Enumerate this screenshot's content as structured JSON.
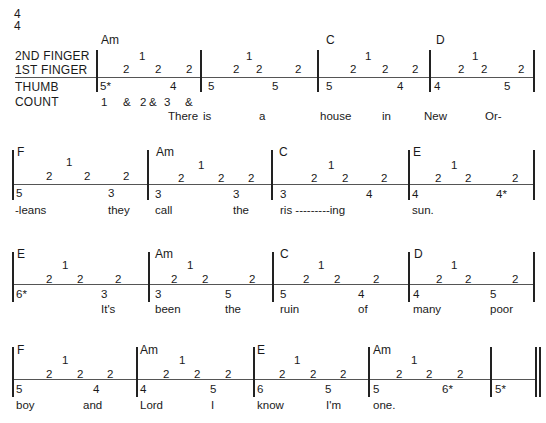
{
  "time_signature": {
    "top": "4",
    "bottom": "4"
  },
  "labels": {
    "second_finger": "2ND FINGER",
    "first_finger": "1ST FINGER",
    "thumb": "THUMB",
    "count": "COUNT"
  },
  "count_values": [
    "1",
    "&",
    "2",
    "&",
    "3",
    "&"
  ],
  "rows": [
    {
      "staff_y": 77,
      "measures": [
        {
          "chord": "Am",
          "f2": "1",
          "f1": [
            "2",
            "2",
            "2"
          ],
          "thumb": [
            "5*",
            "4"
          ]
        },
        {
          "chord": "",
          "f2": "1",
          "f1": [
            "2",
            "2",
            "2"
          ],
          "thumb": [
            "5",
            "5"
          ]
        },
        {
          "chord": "C",
          "f2": "1",
          "f1": [
            "2",
            "2",
            "2"
          ],
          "thumb": [
            "5",
            "4"
          ]
        },
        {
          "chord": "D",
          "f2": "1",
          "f1": [
            "2",
            "2",
            "2"
          ],
          "thumb": [
            "4",
            "5"
          ]
        }
      ],
      "lyrics": [
        "There",
        "is",
        "a",
        "house",
        "in",
        "New",
        "Or-"
      ]
    },
    {
      "staff_y": 184,
      "measures": [
        {
          "chord": "F",
          "f2": "1",
          "f1": [
            "2",
            "2",
            "2"
          ],
          "thumb": [
            "5",
            "3"
          ]
        },
        {
          "chord": "Am",
          "f2": "1",
          "f1": [
            "2",
            "2",
            "2"
          ],
          "thumb": [
            "3",
            "3"
          ]
        },
        {
          "chord": "C",
          "f2": "1",
          "f1": [
            "2",
            "2",
            "2"
          ],
          "thumb": [
            "3",
            "4"
          ]
        },
        {
          "chord": "E",
          "f2": "1",
          "f1": [
            "2",
            "2",
            "2"
          ],
          "thumb": [
            "4",
            "4*"
          ]
        }
      ],
      "lyrics": [
        "-leans",
        "they",
        "call",
        "the",
        "ris ---------ing",
        "sun."
      ]
    },
    {
      "staff_y": 284,
      "measures": [
        {
          "chord": "E",
          "f2": "1",
          "f1": [
            "2",
            "2",
            "2"
          ],
          "thumb": [
            "6*",
            "3"
          ]
        },
        {
          "chord": "Am",
          "f2": "1",
          "f1": [
            "2",
            "2",
            "2"
          ],
          "thumb": [
            "3",
            "5"
          ]
        },
        {
          "chord": "C",
          "f2": "1",
          "f1": [
            "2",
            "2",
            "2"
          ],
          "thumb": [
            "5",
            "4"
          ]
        },
        {
          "chord": "D",
          "f2": "1",
          "f1": [
            "2",
            "2",
            "2"
          ],
          "thumb": [
            "4",
            "5"
          ]
        }
      ],
      "lyrics": [
        "It's",
        "been",
        "the",
        "ruin",
        "of",
        "many",
        "poor"
      ]
    },
    {
      "staff_y": 379,
      "measures": [
        {
          "chord": "F",
          "f2": "1",
          "f1": [
            "2",
            "2",
            "2"
          ],
          "thumb": [
            "5",
            "4"
          ]
        },
        {
          "chord": "Am",
          "f2": "1",
          "f1": [
            "2",
            "2",
            "2"
          ],
          "thumb": [
            "4",
            "5"
          ]
        },
        {
          "chord": "E",
          "f2": "1",
          "f1": [
            "2",
            "2",
            "2"
          ],
          "thumb": [
            "6",
            "5"
          ]
        },
        {
          "chord": "Am",
          "f2": "1",
          "f1": [
            "2",
            "2",
            "2"
          ],
          "thumb": [
            "5",
            "6*"
          ]
        },
        {
          "chord": "",
          "f2": "",
          "f1": [],
          "thumb": [
            "5*"
          ]
        }
      ],
      "lyrics": [
        "boy",
        "and",
        "Lord",
        "I",
        "know",
        "I'm",
        "one."
      ]
    }
  ]
}
